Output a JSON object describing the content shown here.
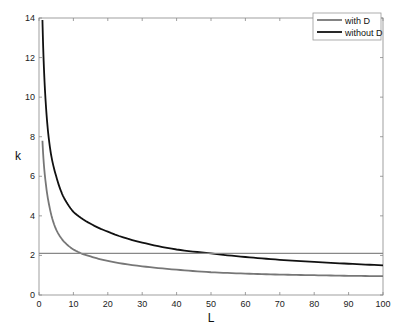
{
  "chart_data": {
    "type": "line",
    "title": "",
    "xlabel": "L",
    "ylabel": "k",
    "xlim": [
      0,
      100
    ],
    "ylim": [
      0,
      14
    ],
    "xticks": [
      0,
      10,
      20,
      30,
      40,
      50,
      60,
      70,
      80,
      90,
      100
    ],
    "yticks": [
      0,
      2,
      4,
      6,
      8,
      10,
      12,
      14
    ],
    "grid": false,
    "legend_position": "upper right",
    "series": [
      {
        "name": "with D",
        "color": "#777777",
        "width": 1.8,
        "x": [
          1,
          2,
          3,
          5,
          7,
          10,
          13,
          15,
          20,
          30,
          40,
          50,
          60,
          70,
          80,
          90,
          100
        ],
        "y": [
          7.8,
          5.6,
          4.5,
          3.3,
          2.75,
          2.3,
          2.05,
          1.95,
          1.72,
          1.45,
          1.28,
          1.15,
          1.08,
          1.03,
          1.0,
          0.97,
          0.95
        ]
      },
      {
        "name": "without D",
        "color": "#111111",
        "width": 1.8,
        "x": [
          1,
          1.5,
          2,
          2.6,
          3.5,
          5,
          7,
          10,
          15,
          20,
          30,
          40,
          50,
          60,
          70,
          80,
          90,
          100
        ],
        "y": [
          13.9,
          11.2,
          9.6,
          8.3,
          7.1,
          6.0,
          5.0,
          4.2,
          3.6,
          3.2,
          2.65,
          2.3,
          2.1,
          1.92,
          1.78,
          1.67,
          1.58,
          1.5
        ]
      },
      {
        "name": "reference line",
        "color": "#888888",
        "width": 1.2,
        "x": [
          0,
          100
        ],
        "y": [
          2.1,
          2.1
        ],
        "in_legend": false
      }
    ]
  },
  "legend": {
    "items": [
      {
        "label": "with D",
        "color": "#777777"
      },
      {
        "label": "without D",
        "color": "#111111"
      }
    ]
  },
  "axes": {
    "xlabel": "L",
    "ylabel": "k"
  }
}
